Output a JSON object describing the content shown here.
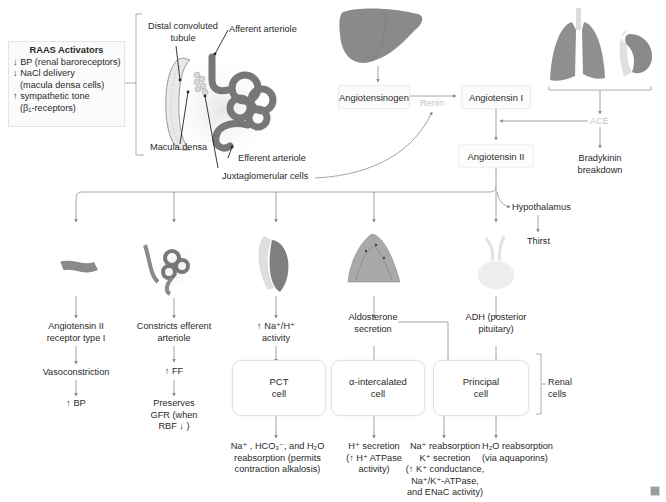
{
  "activators": {
    "title": "RAAS Activators",
    "items": [
      "↓ BP (renal baroreceptors)",
      "↓ NaCl delivery",
      "(macula densa cells)",
      "↑ sympathetic tone",
      "(β₁-receptors)"
    ]
  },
  "nephron_labels": {
    "dct_line1": "Distal convoluted",
    "dct_line2": "tubule",
    "afferent": "Afferent arteriole",
    "macula": "Macula densa",
    "efferent": "Efferent arteriole",
    "jg": "Juxtaglomerular cells"
  },
  "cascade": {
    "angiotensinogen": "Angiotensinogen",
    "renin": "Renin",
    "angiotensin1": "Angiotensin I",
    "ace": "ACE",
    "angiotensin2": "Angiotensin II",
    "bradykinin_line1": "Bradykinin",
    "bradykinin_line2": "breakdown",
    "hypothalamus": "Hypothalamus",
    "thirst": "Thirst"
  },
  "branches": {
    "at1r": {
      "l1": "Angiotensin II",
      "l2": "receptor type I",
      "step1": "Vasoconstriction",
      "step2": "↑ BP"
    },
    "efferent": {
      "l1": "Constricts efferent",
      "l2": "arteriole",
      "step1": "↑ FF",
      "step2_l1": "Preserves",
      "step2_l2": "GFR (when",
      "step2_l3": "RBF ↓ )"
    },
    "nah": {
      "l1": "↑ Na⁺/H⁺",
      "l2": "activity"
    },
    "aldo": {
      "l1": "Aldosterone",
      "l2": "secretion"
    },
    "adh": {
      "l1": "ADH (posterior",
      "l2": "pituitary)"
    }
  },
  "cells": {
    "pct": {
      "l1": "PCT",
      "l2": "cell"
    },
    "alpha": {
      "l1": "α-intercalated",
      "l2": "cell"
    },
    "principal": {
      "l1": "Principal",
      "l2": "cell"
    },
    "renal_l1": "Renal",
    "renal_l2": "cells"
  },
  "outcomes": {
    "pct": [
      "Na⁺ , HCO₃⁻, and H₂O",
      "reabsorption (permits",
      "contraction alkalosis)"
    ],
    "alpha": [
      "H⁺ secretion",
      "(↑ H⁺ ATPase",
      "activity)"
    ],
    "principal": [
      "Na⁺ reabsorption",
      "K⁺ secretion",
      "(↑ K⁺ conductance,",
      "Na⁺/K⁺-ATPase,",
      "and ENaC activity)"
    ],
    "adh": [
      "H₂O reabsorption",
      "(via aquaporins)"
    ]
  },
  "colors": {
    "organ": "#8a8a8a",
    "organ_light": "#c9c9c9",
    "line": "#9a9a9a",
    "faint_text": "#c5c5c5"
  }
}
